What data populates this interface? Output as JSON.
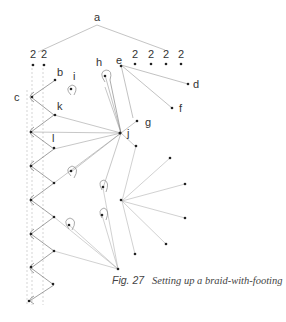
{
  "caption": {
    "figure_number": "Fig. 27",
    "text": "Setting up a braid-with-footing"
  },
  "labels": {
    "a": "a",
    "b": "b",
    "c": "c",
    "d": "d",
    "e": "e",
    "f": "f",
    "g": "g",
    "h": "h",
    "i": "i",
    "j": "j",
    "k": "k",
    "l": "l"
  },
  "pair_counts": [
    "2",
    "2",
    "2",
    "2",
    "2",
    "2"
  ],
  "colors": {
    "line": "#9a9a9a",
    "dot": "#222222",
    "text": "#333333"
  }
}
